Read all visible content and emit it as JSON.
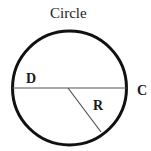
{
  "diagram": {
    "title": "Circle",
    "labels": {
      "diameter": "D",
      "circumference": "C",
      "radius": "R"
    },
    "colors": {
      "circle_stroke": "#111111",
      "line_stroke": "#555555",
      "background": "#ffffff"
    }
  }
}
